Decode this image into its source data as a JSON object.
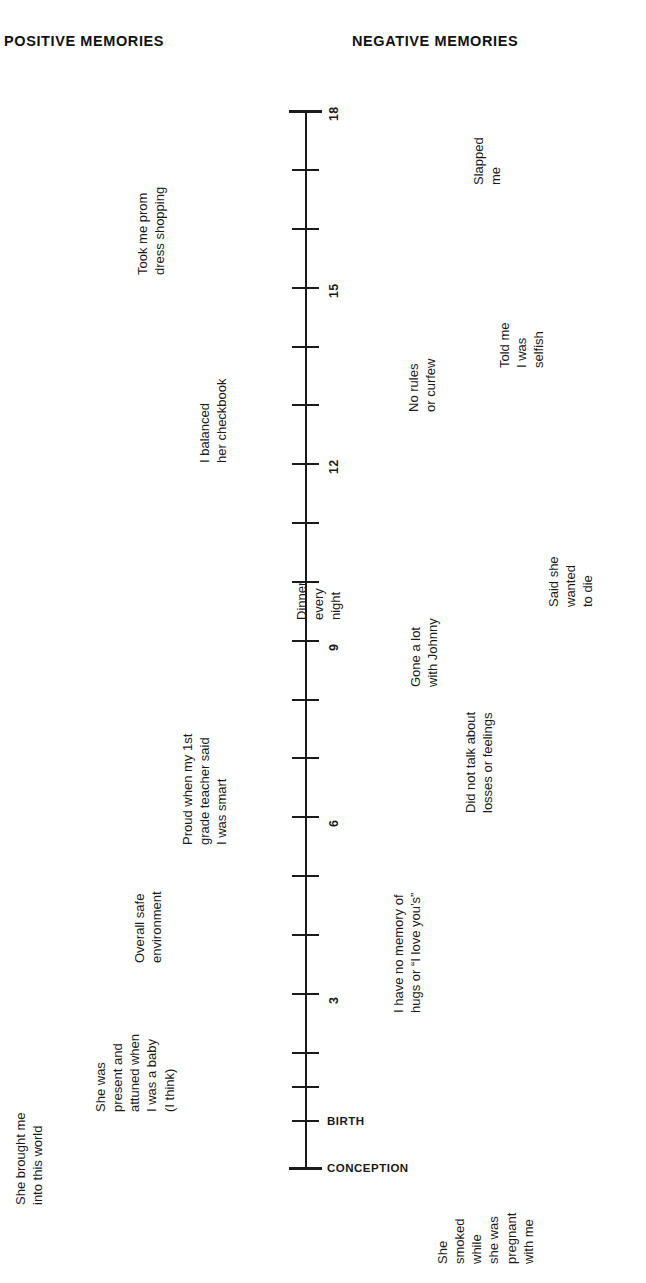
{
  "headers": {
    "positive": "POSITIVE MEMORIES",
    "negative": "NEGATIVE MEMORIES"
  },
  "chart_data": {
    "type": "timeline",
    "orientation": "vertical",
    "axis": {
      "label_bottom": "CONCEPTION",
      "label_birth": "BIRTH",
      "min_age": 0,
      "max_age": 18,
      "tick_interval": 1,
      "numbered_ticks": [
        "3",
        "6",
        "9",
        "12",
        "15",
        "18"
      ],
      "grid": false
    },
    "milestones": [
      {
        "name": "BIRTH",
        "y": 1121
      },
      {
        "name": "CONCEPTION",
        "y": 1168
      }
    ],
    "ticks": [
      {
        "age": 18,
        "y": 111,
        "label": "18",
        "endcap": true
      },
      {
        "age": 17,
        "y": 170,
        "label": "",
        "endcap": false
      },
      {
        "age": 16,
        "y": 229,
        "label": "",
        "endcap": false
      },
      {
        "age": 15,
        "y": 288,
        "label": "15",
        "endcap": false
      },
      {
        "age": 14,
        "y": 347,
        "label": "",
        "endcap": false
      },
      {
        "age": 13,
        "y": 405,
        "label": "",
        "endcap": false
      },
      {
        "age": 12,
        "y": 464,
        "label": "12",
        "endcap": false
      },
      {
        "age": 11,
        "y": 523,
        "label": "",
        "endcap": false
      },
      {
        "age": 10,
        "y": 582,
        "label": "",
        "endcap": false
      },
      {
        "age": 9,
        "y": 641,
        "label": "9",
        "endcap": false
      },
      {
        "age": 8,
        "y": 700,
        "label": "",
        "endcap": false
      },
      {
        "age": 7,
        "y": 758,
        "label": "",
        "endcap": false
      },
      {
        "age": 6,
        "y": 817,
        "label": "6",
        "endcap": false
      },
      {
        "age": 5,
        "y": 876,
        "label": "",
        "endcap": false
      },
      {
        "age": 4,
        "y": 935,
        "label": "",
        "endcap": false
      },
      {
        "age": 3,
        "y": 994,
        "label": "3",
        "endcap": false
      },
      {
        "age": 2,
        "y": 1053,
        "label": "",
        "endcap": false
      },
      {
        "age": 1,
        "y": 1087,
        "label": "",
        "endcap": false
      },
      {
        "age": 0,
        "y": 1121,
        "label": "",
        "endcap": false
      },
      {
        "age": -1,
        "y": 1168,
        "label": "",
        "endcap": true
      }
    ],
    "positive_memories": [
      {
        "id": "brought-me-into-world",
        "lines": [
          "She brought me",
          "into this world"
        ],
        "x": 12,
        "y": 1205,
        "approx_age": "conception"
      },
      {
        "id": "present-and-attuned",
        "lines": [
          "She was",
          "present and",
          "attuned when",
          "I was a baby",
          "(I think)"
        ],
        "x": 92,
        "y": 1112,
        "approx_age": 0
      },
      {
        "id": "overall-safe-environment",
        "lines": [
          "Overall safe",
          "environment"
        ],
        "x": 131,
        "y": 963,
        "approx_age": 4
      },
      {
        "id": "proud-first-grade-teacher",
        "lines": [
          "Proud when my 1st",
          "grade teacher said",
          "I was smart"
        ],
        "x": 179,
        "y": 845,
        "approx_age": 6
      },
      {
        "id": "dinner-every-night",
        "lines": [
          "Dinner",
          "every",
          "night"
        ],
        "x": 293,
        "y": 620,
        "approx_age": 9
      },
      {
        "id": "balanced-her-checkbook",
        "lines": [
          "I balanced",
          "her checkbook"
        ],
        "x": 196,
        "y": 463,
        "approx_age": 12
      },
      {
        "id": "prom-dress-shopping",
        "lines": [
          "Took me prom",
          "dress shopping"
        ],
        "x": 134,
        "y": 275,
        "approx_age": 16
      }
    ],
    "negative_memories": [
      {
        "id": "smoked-while-pregnant",
        "lines": [
          "She",
          "smoked",
          "while",
          "she was",
          "pregnant",
          "with me"
        ],
        "x": 434,
        "y": 1264,
        "approx_age": "conception"
      },
      {
        "id": "no-memory-of-hugs",
        "lines": [
          "I have no memory of",
          "hugs or “I love you’s”"
        ],
        "x": 390,
        "y": 1013,
        "approx_age": 3
      },
      {
        "id": "did-not-talk-about-losses",
        "lines": [
          "Did not talk about",
          "losses or feelings"
        ],
        "x": 462,
        "y": 813,
        "approx_age": 8
      },
      {
        "id": "gone-a-lot-with-johnny",
        "lines": [
          "Gone a lot",
          "with Johnny"
        ],
        "x": 407,
        "y": 687,
        "approx_age": 9
      },
      {
        "id": "said-she-wanted-to-die",
        "lines": [
          "Said she",
          "wanted",
          "to die"
        ],
        "x": 545,
        "y": 607,
        "approx_age": 10
      },
      {
        "id": "no-rules-or-curfew",
        "lines": [
          "No rules",
          "or curfew"
        ],
        "x": 405,
        "y": 412,
        "approx_age": 13
      },
      {
        "id": "told-me-i-was-selfish",
        "lines": [
          "Told me",
          "I was",
          "selfish"
        ],
        "x": 496,
        "y": 368,
        "approx_age": 15
      },
      {
        "id": "slapped-me",
        "lines": [
          "Slapped",
          "me"
        ],
        "x": 470,
        "y": 185,
        "approx_age": 17
      }
    ]
  },
  "colors": {
    "ink": "#1a1a1a",
    "background": "#ffffff"
  }
}
